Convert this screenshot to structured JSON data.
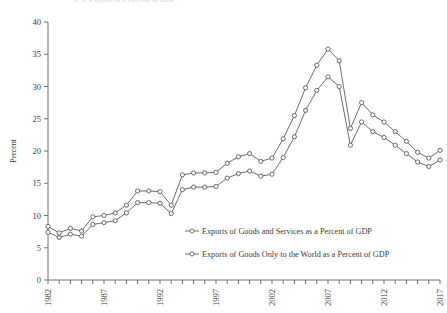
{
  "figure": {
    "cut_off_header": "U.S. Exports as a Percent of GDP",
    "axis": {
      "y_title": "Percent",
      "y_ticks": [
        0,
        5,
        10,
        15,
        20,
        25,
        30,
        35,
        40
      ],
      "y_range": [
        0,
        40
      ],
      "x_ticks_labeled": [
        1982,
        1987,
        1992,
        1997,
        2002,
        2007,
        2012,
        2017
      ],
      "x_range": [
        1982,
        2017
      ],
      "x_tick_interval": 1
    },
    "legend": {
      "items": [
        {
          "marker": "open-circle-line",
          "label": "Exports of Goods and Services as a Percent of GDP"
        },
        {
          "marker": "open-circle-line",
          "label": "Exports of Goods Only to the World as a Percent of GDP"
        }
      ]
    },
    "colors": {
      "line": "#5a5a5a",
      "marker_fill": "#ffffff",
      "axis": "#6e6e6e",
      "text": "#3a3a3a"
    }
  },
  "chart_data": {
    "type": "line",
    "title": "",
    "xlabel": "",
    "ylabel": "Percent",
    "ylim": [
      0,
      40
    ],
    "xlim": [
      1982,
      2017
    ],
    "grid": false,
    "legend_position": "center-right-inside",
    "x": [
      1982,
      1983,
      1984,
      1985,
      1986,
      1987,
      1988,
      1989,
      1990,
      1991,
      1992,
      1993,
      1994,
      1995,
      1996,
      1997,
      1998,
      1999,
      2000,
      2001,
      2002,
      2003,
      2004,
      2005,
      2006,
      2007,
      2008,
      2009,
      2010,
      2011,
      2012,
      2013,
      2014,
      2015,
      2016,
      2017
    ],
    "series": [
      {
        "name": "Exports of Goods and Services as a Percent of GDP",
        "marker": "open-circle",
        "values": [
          8.3,
          7.3,
          8.0,
          7.6,
          9.8,
          10.0,
          10.4,
          11.6,
          13.8,
          13.8,
          13.7,
          11.6,
          16.3,
          16.6,
          16.6,
          16.7,
          18.1,
          19.1,
          19.6,
          18.4,
          18.9,
          21.9,
          25.5,
          29.8,
          33.3,
          35.8,
          34.0,
          23.5,
          27.5,
          25.6,
          24.5,
          23.0,
          21.5,
          19.8,
          18.9,
          20.1
        ]
      },
      {
        "name": "Exports of Goods Only to the World as a Percent of GDP",
        "marker": "open-circle",
        "values": [
          7.4,
          6.6,
          7.1,
          6.8,
          8.6,
          8.9,
          9.2,
          10.4,
          12.0,
          12.0,
          11.9,
          10.3,
          14.0,
          14.4,
          14.4,
          14.5,
          15.8,
          16.5,
          16.9,
          16.1,
          16.4,
          19.0,
          22.2,
          26.3,
          29.4,
          31.5,
          30.0,
          20.9,
          24.5,
          23.0,
          22.1,
          20.9,
          19.6,
          18.3,
          17.6,
          18.6
        ]
      }
    ]
  }
}
